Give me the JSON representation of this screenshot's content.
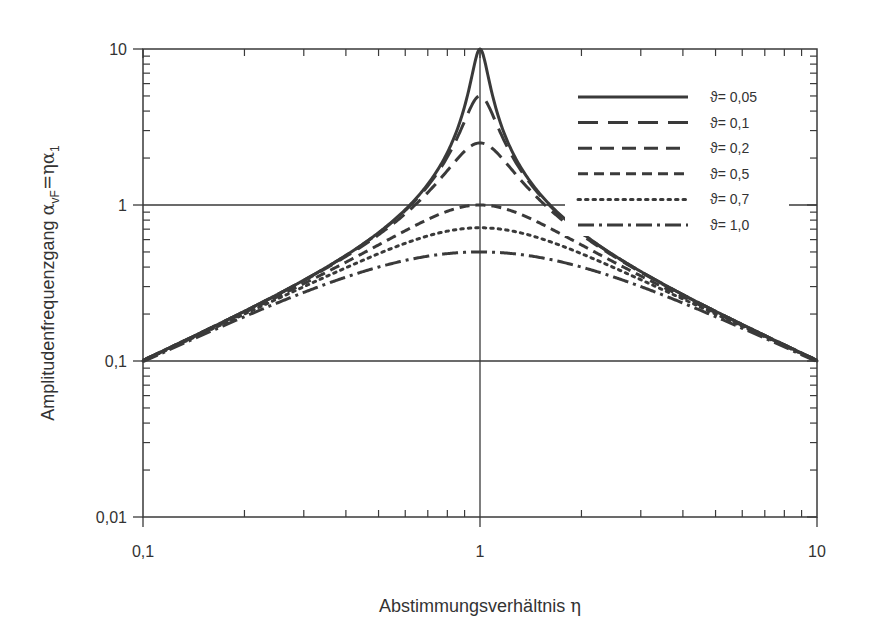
{
  "chart_data": {
    "type": "line",
    "title": "",
    "xlabel": "Abstimmungsverhältnis η",
    "ylabel": "Amplitudenfrequenzgang α_vF=ηα_1",
    "xlabel_text": "Abstimmungsverhältnis ",
    "xlabel_symbol": "η",
    "ylabel_text": "Amplitudenfrequenzgang ",
    "ylabel_alpha": "α",
    "ylabel_sub1": "vF",
    "ylabel_eq": "=ηα",
    "ylabel_sub2": "1",
    "xscale": "log",
    "yscale": "log",
    "xlim": [
      0.1,
      10
    ],
    "ylim": [
      0.01,
      10
    ],
    "xticks": [
      0.1,
      1,
      10
    ],
    "xtick_labels": [
      "0,1",
      "1",
      "10"
    ],
    "yticks": [
      0.01,
      0.1,
      1,
      10
    ],
    "ytick_labels": [
      "0,01",
      "0,1",
      "1",
      "10"
    ],
    "grid": {
      "x": [
        1
      ],
      "y": [
        0.1,
        1
      ]
    },
    "legend_position": "upper right (inside)",
    "formula": "α_vF = η / sqrt((1-η²)² + (2ϑη)²)",
    "x": [
      0.1,
      0.2,
      0.3,
      0.5,
      0.7,
      0.9,
      1.0,
      1.2,
      1.5,
      2,
      3,
      5,
      10
    ],
    "series": [
      {
        "name": "ϑ= 0,05",
        "label": "ϑ= 0,05",
        "damping": 0.05,
        "dash": "",
        "width": 3,
        "values": [
          0.101,
          0.208,
          0.33,
          0.665,
          1.37,
          4.63,
          10.0,
          2.7,
          1.19,
          0.666,
          0.375,
          0.208,
          0.101
        ]
      },
      {
        "name": "ϑ= 0,1",
        "label": "ϑ= 0,1",
        "damping": 0.1,
        "dash": "20 10",
        "width": 3,
        "values": [
          0.101,
          0.208,
          0.329,
          0.663,
          1.34,
          3.71,
          5.0,
          2.51,
          1.17,
          0.664,
          0.374,
          0.208,
          0.101
        ]
      },
      {
        "name": "ϑ= 0,2",
        "label": "ϑ= 0,2",
        "damping": 0.2,
        "dash": "14 8",
        "width": 3,
        "values": [
          0.101,
          0.207,
          0.326,
          0.65,
          1.247,
          2.22,
          2.5,
          1.97,
          1.09,
          0.654,
          0.371,
          0.208,
          0.101
        ]
      },
      {
        "name": "ϑ= 0,5",
        "label": "ϑ= 0,5",
        "damping": 0.5,
        "dash": "10 6",
        "width": 3,
        "values": [
          0.1,
          0.2,
          0.3,
          0.555,
          0.844,
          0.988,
          1.0,
          0.984,
          0.923,
          0.4,
          0.3,
          0.192,
          0.1
        ]
      },
      {
        "name": "ϑ= 0,7",
        "label": "ϑ= 0,7",
        "damping": 0.7,
        "dash": "2.5 5",
        "width": 3,
        "values": [
          0.099,
          0.193,
          0.276,
          0.501,
          0.645,
          0.701,
          0.714,
          0.699,
          0.654,
          0.536,
          0.318,
          0.189,
          0.099
        ]
      },
      {
        "name": "ϑ= 1,0",
        "label": "ϑ= 1,0",
        "damping": 1.0,
        "dash": "16 5 3 5",
        "width": 3,
        "values": [
          0.099,
          0.192,
          0.275,
          0.4,
          0.47,
          0.497,
          0.5,
          0.492,
          0.462,
          0.4,
          0.3,
          0.192,
          0.099
        ]
      }
    ]
  },
  "style": {
    "line_color": "#3a3a3a",
    "axis_color": "#3a3a3a",
    "text_color": "#333333",
    "background": "#ffffff"
  }
}
